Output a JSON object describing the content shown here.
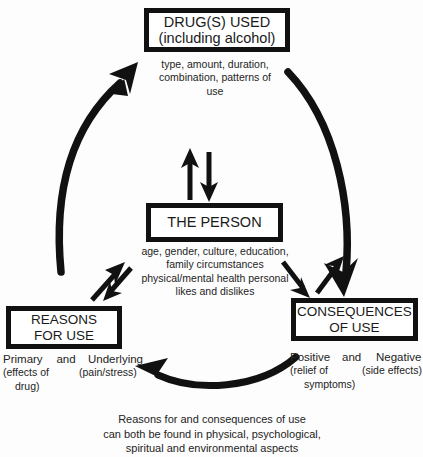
{
  "diagram": {
    "title_present": false,
    "ink_color": "#111111",
    "background_color": "#ffffff",
    "nodes": {
      "drugs": {
        "label_line1": "DRUG(S) USED",
        "label_line2": "(including alcohol)",
        "details": [
          "type, amount,",
          "duration,",
          "combination,",
          "patterns of use"
        ]
      },
      "person": {
        "label_line1": "THE PERSON",
        "details": [
          "age, gender, culture,",
          "education, family",
          "circumstances",
          "physical/mental health",
          "personal likes and",
          "dislikes"
        ]
      },
      "reasons": {
        "label_line1": "REASONS",
        "label_line2": "FOR USE",
        "sub_primary": "Primary",
        "sub_and": "and",
        "sub_underlying": "Underlying",
        "sub_primary_detail_line1": "(effects  of",
        "sub_primary_detail_line2": "drug)",
        "sub_underlying_detail": "(pain/stress)"
      },
      "consequences": {
        "label_line1": "CONSEQUENCES",
        "label_line2": "OF USE",
        "sub_positive": "Positive",
        "sub_and": "and",
        "sub_negative": "Negative",
        "sub_positive_detail_line1": "(relief  of",
        "sub_positive_detail_line2": "symptoms)",
        "sub_negative_detail": "(side effects)"
      }
    },
    "footer_note": [
      "Reasons for and consequences of use",
      "can both be found in physical, psychological,",
      "spiritual and environmental aspects"
    ],
    "connectors": [
      {
        "name": "reasons-to-drugs-arc",
        "from": "reasons",
        "to": "drugs",
        "direction": "up-left-arc",
        "arrowhead": "at-drugs"
      },
      {
        "name": "drugs-to-consequences-arc",
        "from": "drugs",
        "to": "consequences",
        "direction": "down-right-arc",
        "arrowhead": "at-consequences"
      },
      {
        "name": "consequences-to-reasons-arc",
        "from": "consequences",
        "to": "reasons",
        "direction": "leftward-bottom-arc",
        "arrowhead": "at-reasons"
      },
      {
        "name": "person-drugs-double-arrow",
        "from": "person",
        "to": "drugs",
        "direction": "bidirectional-vertical",
        "arrowhead": "both"
      },
      {
        "name": "person-reasons-double-arrow",
        "from": "person",
        "to": "reasons",
        "direction": "bidirectional-diagonal",
        "arrowhead": "both"
      },
      {
        "name": "person-consequences-double-arrow",
        "from": "person",
        "to": "consequences",
        "direction": "bidirectional-diagonal",
        "arrowhead": "both"
      }
    ]
  }
}
